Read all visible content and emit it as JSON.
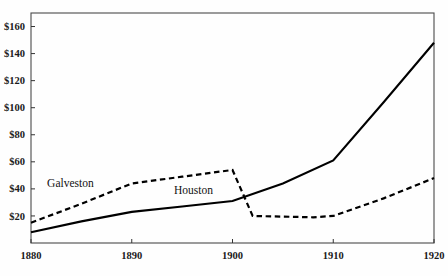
{
  "chart_data": {
    "type": "line",
    "title": "",
    "xlabel": "",
    "ylabel": "",
    "xlim": [
      1880,
      1920
    ],
    "ylim": [
      0,
      170
    ],
    "grid": false,
    "legend_position": "inline-labels",
    "y_ticks": [
      20,
      40,
      60,
      80,
      100,
      120,
      140,
      160
    ],
    "y_tick_labels": [
      "$20",
      "$40",
      "$60",
      "$80",
      "$100",
      "$120",
      "$140",
      "$160"
    ],
    "x_ticks": [
      1880,
      1890,
      1900,
      1910,
      1920
    ],
    "x_tick_labels": [
      "1880",
      "1890",
      "1900",
      "1910",
      "1920"
    ],
    "series": [
      {
        "name": "Houston",
        "style": "solid",
        "color": "#000000",
        "label_position": {
          "x": 1894.2,
          "y": 36.5
        },
        "x": [
          1880,
          1885,
          1890,
          1895,
          1900,
          1905,
          1910,
          1915,
          1920
        ],
        "values": [
          8,
          16,
          23,
          27,
          31,
          44,
          61,
          104,
          148
        ]
      },
      {
        "name": "Galveston",
        "style": "dashed",
        "color": "#000000",
        "label_position": {
          "x": 1881.6,
          "y": 41.5
        },
        "x": [
          1880,
          1885,
          1890,
          1895,
          1900,
          1902,
          1905,
          1908,
          1910,
          1915,
          1920
        ],
        "values": [
          15,
          29,
          44,
          49,
          54,
          20,
          19.5,
          19,
          20,
          33,
          48
        ]
      }
    ]
  },
  "labels": {
    "galveston": "Galveston",
    "houston": "Houston"
  },
  "colors": {
    "line": "#000000",
    "frame": "#4a4a4a",
    "background": "#fefefe",
    "text": "#1a1a1a"
  }
}
